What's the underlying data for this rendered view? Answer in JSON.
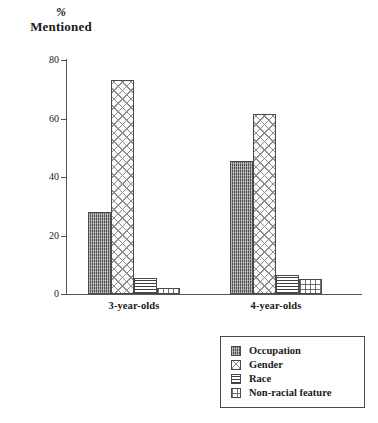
{
  "chart_data": {
    "type": "bar",
    "title": "% Mentioned",
    "title_lines": [
      "%",
      "Mentioned"
    ],
    "xlabel": "",
    "ylabel": "% Mentioned",
    "ylim": [
      0,
      80
    ],
    "yticks": [
      0,
      20,
      40,
      60,
      80
    ],
    "ytick_labels": [
      "0",
      "20",
      "40",
      "60",
      "80"
    ],
    "grid": false,
    "legend_position": "bottom-right",
    "categories": [
      "3-year-olds",
      "4-year-olds"
    ],
    "series": [
      {
        "name": "Occupation",
        "values": [
          28,
          45.5
        ],
        "pattern": "pat-occupation"
      },
      {
        "name": "Gender",
        "values": [
          73,
          61.5
        ],
        "pattern": "pat-gender"
      },
      {
        "name": "Race",
        "values": [
          5.5,
          6.5
        ],
        "pattern": "pat-race"
      },
      {
        "name": "Non-racial feature",
        "values": [
          2,
          5
        ],
        "pattern": "pat-nonracial"
      }
    ],
    "colors": {
      "axis": "#555555",
      "bar_outline": "#4a4a4a",
      "text": "#1a1a1a",
      "background": "#ffffff"
    }
  },
  "legend": {
    "items": [
      {
        "label": "Occupation"
      },
      {
        "label": "Gender"
      },
      {
        "label": "Race"
      },
      {
        "label": "Non-racial feature"
      }
    ]
  }
}
